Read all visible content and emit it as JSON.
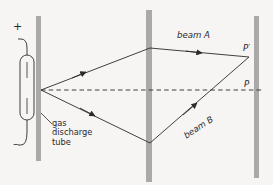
{
  "figure": {
    "background_color": "#f6f5f3",
    "line_color": "#2b2b2b",
    "barrier_color": "#a9a9a9"
  },
  "labels": {
    "positive_terminal": "+",
    "negative_terminal": "–",
    "source_caption_line1": "gas",
    "source_caption_line2": "discharge",
    "source_caption_line3": "tube",
    "beam_a": "beam A",
    "beam_b": "beam B",
    "point_p_prime": "P′",
    "point_p": "P"
  },
  "geometry": {
    "source_point": {
      "x": 41,
      "y": 90
    },
    "barriers": [
      {
        "name": "left-barrier",
        "x": 36,
        "y": 16,
        "width": 5,
        "height": 145
      },
      {
        "name": "middle-barrier",
        "x": 146,
        "y": 10,
        "width": 6,
        "height": 172
      },
      {
        "name": "right-barrier",
        "x": 254,
        "y": 16,
        "width": 5,
        "height": 162
      }
    ],
    "beam_a_path": [
      [
        41,
        90
      ],
      [
        150,
        48
      ],
      [
        249,
        57
      ]
    ],
    "beam_b_path": [
      [
        41,
        90
      ],
      [
        150,
        143
      ],
      [
        249,
        57
      ]
    ],
    "axis_dashed_line": [
      [
        41,
        90
      ],
      [
        262,
        90
      ]
    ],
    "tube": {
      "x": 20,
      "y": 55,
      "width": 14,
      "height": 65
    }
  }
}
